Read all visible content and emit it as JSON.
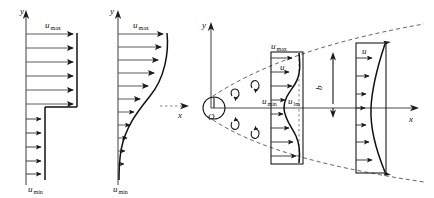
{
  "figure": {
    "panels": [
      {
        "id": "panel-1",
        "name": "uniform-step-velocity-profile",
        "axis_y_label": "y",
        "top_label": "u",
        "top_label_sub": "max",
        "bottom_label": "u",
        "bottom_label_sub": "min",
        "top_arrow_count": 6,
        "bottom_arrow_count": 5,
        "profile_type": "step"
      },
      {
        "id": "panel-2",
        "name": "s-curve-velocity-profile",
        "axis_y_label": "y",
        "axis_x_label": "x",
        "top_label": "u",
        "top_label_sub": "max",
        "bottom_label": "u",
        "bottom_label_sub": "min",
        "arrow_count": 11,
        "profile_type": "s-curve"
      },
      {
        "id": "panel-3",
        "name": "jet-spreading-diagram",
        "axis_y_label": "y",
        "axis_x_label": "x",
        "origin_label": "O",
        "width_label": "b",
        "section_near": {
          "name": "near-section-profile",
          "labels": [
            {
              "main": "u",
              "sub": "max"
            },
            {
              "main": "u",
              "sub": ""
            },
            {
              "main": "u",
              "sub": "min"
            },
            {
              "main": "u",
              "sub": "lm"
            }
          ],
          "arrow_count": 8
        },
        "section_far": {
          "name": "far-section-profile",
          "labels": [
            {
              "main": "u",
              "sub": ""
            }
          ],
          "arrow_count": 7
        },
        "vortex_count": 4,
        "boundary_style": "dashed"
      }
    ],
    "colors": {
      "line": "#1a1a1a",
      "axis": "#4d4d4d",
      "vector": "#4a4a4a",
      "dashed": "#555555",
      "background": "#ffffff"
    }
  }
}
